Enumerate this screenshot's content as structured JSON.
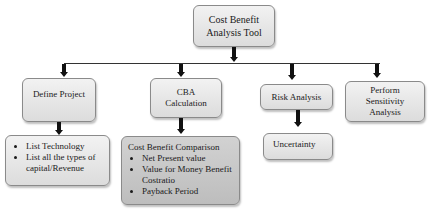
{
  "root": {
    "label_line1": "Cost Benefit",
    "label_line2": "Analysis Tool"
  },
  "level1": [
    {
      "id": "define-project",
      "label": "Define Project"
    },
    {
      "id": "cba-calculation",
      "label_line1": "CBA",
      "label_line2": "Calculation"
    },
    {
      "id": "risk-analysis",
      "label": "Risk Analysis"
    },
    {
      "id": "perform-sensitivity",
      "label_line1": "Perform",
      "label_line2": "Sensitivity",
      "label_line3": "Analysis"
    }
  ],
  "level2": {
    "define_project_items": [
      "List Technology",
      "List all the types of capital/Revenue"
    ],
    "cba": {
      "heading": "Cost Benefit Comparison",
      "items": [
        "Net Present value",
        "Value for Money Benefit Costratio",
        "Payback Period"
      ]
    },
    "risk": {
      "label": "Uncertainty"
    }
  },
  "colors": {
    "box_light": "#e6e6e6",
    "box_dark": "#c8c8c8",
    "border": "#8a8a8a",
    "arrow": "#111111"
  }
}
